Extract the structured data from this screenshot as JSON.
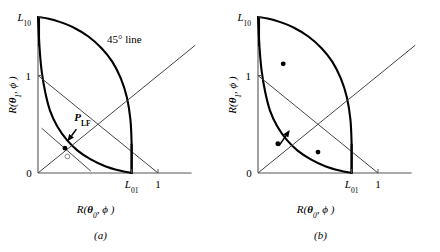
{
  "figure": {
    "caption_a": "(a)",
    "caption_b": "(b)",
    "annotation_45": "45° line",
    "point_label_main": "P",
    "point_label_sub": "LF"
  },
  "axes": {
    "x_label_prefix": "R(",
    "x_label_theta": "θ",
    "x_label_theta_sub": "0",
    "x_label_suffix": ", ϕ )",
    "y_label_prefix": "R(",
    "y_label_theta": "θ",
    "y_label_theta_sub": "1",
    "y_label_suffix": ", ϕ )",
    "x_ticks": [
      {
        "label": "0",
        "sub": "",
        "value": 0
      },
      {
        "label": "L",
        "sub": "01",
        "value": 0.78
      },
      {
        "label": "1",
        "sub": "",
        "value": 1
      }
    ],
    "y_ticks": [
      {
        "label": "0",
        "sub": "",
        "value": 0
      },
      {
        "label": "1",
        "sub": "",
        "value": 1
      },
      {
        "label": "L",
        "sub": "10",
        "value": 1.6
      }
    ],
    "x_range": [
      0,
      1.28
    ],
    "y_range": [
      0,
      1.6
    ]
  },
  "chart_data": {
    "type": "line",
    "title": "",
    "xlabel": "R(θ₀, ϕ)",
    "ylabel": "R(θ₁, ϕ)",
    "xlim": [
      0,
      1.28
    ],
    "ylim": [
      0,
      1.6
    ],
    "grid": false,
    "legend": "none",
    "panels": [
      {
        "name": "a",
        "caption": "(a)",
        "series": [
          {
            "name": "risk-set-upper-boundary",
            "description": "Upper concave boundary of the risk set from L10 to L01",
            "type": "curve",
            "points": [
              [
                0.0,
                1.6
              ],
              [
                0.08,
                1.585
              ],
              [
                0.18,
                1.55
              ],
              [
                0.3,
                1.49
              ],
              [
                0.42,
                1.4
              ],
              [
                0.53,
                1.28
              ],
              [
                0.62,
                1.14
              ],
              [
                0.69,
                0.97
              ],
              [
                0.74,
                0.78
              ],
              [
                0.77,
                0.55
              ],
              [
                0.78,
                0.3
              ],
              [
                0.78,
                0.0
              ]
            ]
          },
          {
            "name": "risk-set-lower-boundary",
            "description": "Lower convex boundary (Bayes risk curve) from L10 to L01",
            "type": "curve",
            "points": [
              [
                0.0,
                1.6
              ],
              [
                0.012,
                1.3
              ],
              [
                0.03,
                1.05
              ],
              [
                0.06,
                0.83
              ],
              [
                0.1,
                0.64
              ],
              [
                0.16,
                0.48
              ],
              [
                0.24,
                0.34
              ],
              [
                0.33,
                0.23
              ],
              [
                0.44,
                0.14
              ],
              [
                0.56,
                0.07
              ],
              [
                0.68,
                0.025
              ],
              [
                0.78,
                0.0
              ]
            ]
          },
          {
            "name": "45-degree-line",
            "description": "Line y = x through origin",
            "type": "line",
            "points": [
              [
                0.0,
                0.0
              ],
              [
                1.31,
                1.31
              ]
            ]
          },
          {
            "name": "minimax-tangent-line",
            "description": "Line from (0,1) down to (1,0)",
            "type": "line",
            "points": [
              [
                0.0,
                1.0
              ],
              [
                1.0,
                0.0
              ]
            ]
          },
          {
            "name": "supporting-hyperplane",
            "description": "Short tangent line touching the lower boundary",
            "type": "line",
            "points": [
              [
                0.03,
                0.46
              ],
              [
                0.44,
                0.02
              ]
            ]
          }
        ],
        "markers": [
          {
            "name": "minimax-point",
            "label": "P_LF",
            "x": 0.225,
            "y": 0.255,
            "style": "dot"
          },
          {
            "name": "secondary-point",
            "label": "",
            "x": 0.245,
            "y": 0.17,
            "style": "open-circle"
          }
        ],
        "arrow": {
          "name": "pointer-to-minimax-point",
          "from": [
            0.32,
            0.45
          ],
          "to": [
            0.245,
            0.325
          ]
        },
        "annotations": [
          {
            "name": "45-degree-label",
            "text": "45° line",
            "x": 0.72,
            "y": 1.33
          },
          {
            "name": "minimax-point-label",
            "text": "P_LF",
            "x": 0.37,
            "y": 0.53
          }
        ]
      },
      {
        "name": "b",
        "caption": "(b)",
        "series": [
          {
            "name": "risk-set-upper-boundary",
            "description": "Upper concave boundary of the risk set from L10 to L01",
            "type": "curve",
            "points": [
              [
                0.0,
                1.6
              ],
              [
                0.08,
                1.585
              ],
              [
                0.18,
                1.55
              ],
              [
                0.3,
                1.49
              ],
              [
                0.42,
                1.4
              ],
              [
                0.53,
                1.28
              ],
              [
                0.62,
                1.14
              ],
              [
                0.69,
                0.97
              ],
              [
                0.74,
                0.78
              ],
              [
                0.77,
                0.55
              ],
              [
                0.78,
                0.3
              ],
              [
                0.78,
                0.0
              ]
            ]
          },
          {
            "name": "risk-set-lower-boundary",
            "description": "Lower convex boundary (Bayes risk curve) from L10 to L01",
            "type": "curve",
            "points": [
              [
                0.0,
                1.6
              ],
              [
                0.012,
                1.3
              ],
              [
                0.03,
                1.05
              ],
              [
                0.06,
                0.83
              ],
              [
                0.1,
                0.64
              ],
              [
                0.16,
                0.48
              ],
              [
                0.24,
                0.34
              ],
              [
                0.33,
                0.23
              ],
              [
                0.44,
                0.14
              ],
              [
                0.56,
                0.07
              ],
              [
                0.68,
                0.025
              ],
              [
                0.78,
                0.0
              ]
            ]
          },
          {
            "name": "45-degree-line",
            "description": "Line y = x through origin",
            "type": "line",
            "points": [
              [
                0.0,
                0.0
              ],
              [
                1.31,
                1.31
              ]
            ]
          },
          {
            "name": "minimax-tangent-line",
            "description": "Line from (0,1) down to (1,0)",
            "type": "line",
            "points": [
              [
                0.0,
                1.0
              ],
              [
                1.0,
                0.0
              ]
            ]
          }
        ],
        "markers": [
          {
            "name": "upper-interior-point",
            "label": "",
            "x": 0.21,
            "y": 1.12,
            "style": "dot"
          },
          {
            "name": "boundary-point",
            "label": "",
            "x": 0.165,
            "y": 0.3,
            "style": "dot"
          },
          {
            "name": "lower-interior-point",
            "label": "",
            "x": 0.5,
            "y": 0.215,
            "style": "dot"
          }
        ],
        "arrow": {
          "name": "pointer-from-boundary-point",
          "from": [
            0.175,
            0.28
          ],
          "to": [
            0.265,
            0.44
          ]
        },
        "annotations": []
      }
    ]
  }
}
